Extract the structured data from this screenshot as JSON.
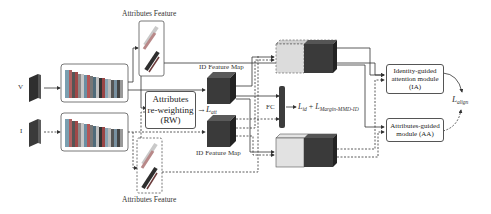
{
  "diagram": {
    "inputs": {
      "visible": "V",
      "infrared": "I"
    },
    "labels": {
      "attr_feature_top": "Attributes Feature",
      "attr_feature_bottom": "Attributes Feature",
      "id_map_top": "ID Feature Map",
      "id_map_bottom": "ID Feature Map",
      "fc": "FC"
    },
    "modules": {
      "rw": {
        "line1": "Attributes",
        "line2": "re-weighting",
        "line3": "(RW)"
      },
      "ia": {
        "line1": "Identity-guided",
        "line2": "attention module",
        "line3": "(IA)"
      },
      "aa": {
        "line1": "Attributes-guided",
        "line2": "module (AA)"
      }
    },
    "losses": {
      "att": {
        "main": "L",
        "sub": "att"
      },
      "id_plus_mmd": {
        "main1": "L",
        "sub1": "id",
        "plus": " + ",
        "main2": "L",
        "sub2": "Margin-MMD-ID"
      },
      "align": {
        "main": "L",
        "sub": "align"
      }
    },
    "colors": {
      "dark_block": "#3a3a3a",
      "light_block": "#d6d6d6",
      "line": "#333333"
    }
  }
}
